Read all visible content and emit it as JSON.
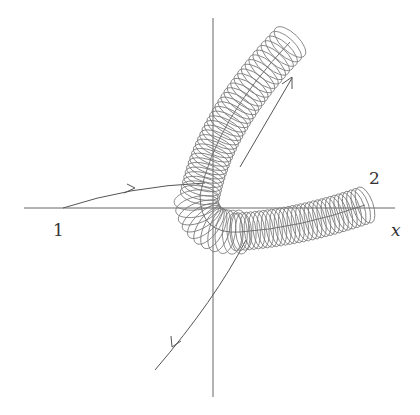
{
  "figure": {
    "labels": {
      "point_1": "1",
      "point_2": "2",
      "x_axis": "x"
    },
    "colors": {
      "line": "#555555",
      "circles": "#777777",
      "text": "#333333"
    }
  }
}
